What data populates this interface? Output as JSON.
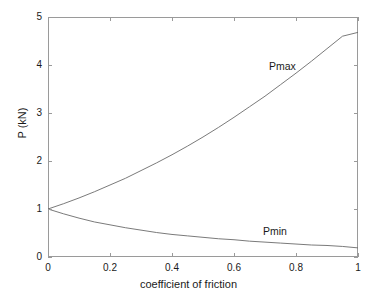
{
  "chart_data": {
    "type": "line",
    "title": "",
    "xlabel": "coefficient of friction",
    "ylabel": "P (kN)",
    "xlim": [
      0,
      1
    ],
    "ylim": [
      0,
      5
    ],
    "xticks": [
      "0",
      "0.2",
      "0.4",
      "0.6",
      "0.8",
      "1"
    ],
    "xtick_values": [
      0,
      0.2,
      0.4,
      0.6,
      0.8,
      1
    ],
    "yticks": [
      "0",
      "1",
      "2",
      "3",
      "4",
      "5"
    ],
    "ytick_values": [
      0,
      1,
      2,
      3,
      4,
      5
    ],
    "grid": false,
    "legend_position": "inline-annotations",
    "line_color": "#6b6b6b",
    "axis_color": "#9a9a9a",
    "text_color": "#1a1a1a",
    "annotations": [
      {
        "text": "Pmax",
        "x": 0.72,
        "y": 4.12
      },
      {
        "text": "Pmin",
        "x": 0.7,
        "y": 0.62
      }
    ],
    "series": [
      {
        "name": "Pmax",
        "x": [
          0,
          0.05,
          0.1,
          0.15,
          0.2,
          0.25,
          0.3,
          0.35,
          0.4,
          0.45,
          0.5,
          0.55,
          0.6,
          0.65,
          0.7,
          0.75,
          0.8,
          0.85,
          0.9,
          0.95,
          1
        ],
        "values": [
          1.0,
          1.11,
          1.23,
          1.36,
          1.5,
          1.64,
          1.8,
          1.96,
          2.13,
          2.31,
          2.5,
          2.7,
          2.91,
          3.13,
          3.35,
          3.59,
          3.83,
          4.08,
          4.34,
          4.6,
          4.68
        ]
      },
      {
        "name": "Pmin",
        "x": [
          0,
          0.05,
          0.1,
          0.15,
          0.2,
          0.25,
          0.3,
          0.35,
          0.4,
          0.45,
          0.5,
          0.55,
          0.6,
          0.65,
          0.7,
          0.75,
          0.8,
          0.85,
          0.9,
          0.95,
          1
        ],
        "values": [
          1.0,
          0.9,
          0.81,
          0.73,
          0.67,
          0.61,
          0.56,
          0.51,
          0.47,
          0.44,
          0.41,
          0.38,
          0.36,
          0.33,
          0.31,
          0.29,
          0.27,
          0.25,
          0.24,
          0.22,
          0.19
        ]
      }
    ]
  }
}
